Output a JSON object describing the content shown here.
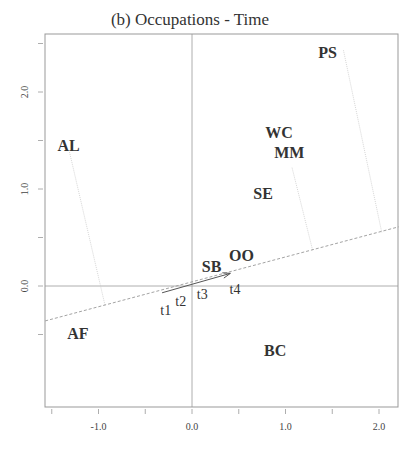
{
  "chart_data": {
    "type": "scatter",
    "title": "(b) Occupations - Time",
    "xlabel": "",
    "ylabel": "",
    "xlim": [
      -1.57,
      2.21
    ],
    "ylim": [
      -1.25,
      2.6
    ],
    "grid": false,
    "reference_lines": {
      "x0": true,
      "y0": true
    },
    "x_ticks": [
      -1.5,
      -1.0,
      -0.5,
      0.0,
      0.5,
      1.0,
      1.5,
      2.0
    ],
    "x_tick_labels": [
      {
        "value": -1.0,
        "label": "-1.0"
      },
      {
        "value": 0.0,
        "label": "0.0"
      },
      {
        "value": 1.0,
        "label": "1.0"
      },
      {
        "value": 2.0,
        "label": "2.0"
      }
    ],
    "y_ticks": [
      -0.5,
      0.0,
      0.5,
      1.0,
      1.5,
      2.0,
      2.5
    ],
    "y_tick_labels": [
      {
        "value": 0.0,
        "label": "0.0"
      },
      {
        "value": 1.0,
        "label": "1.0"
      },
      {
        "value": 2.0,
        "label": "2.0"
      }
    ],
    "series": [
      {
        "name": "Occupations",
        "style": "bold-label",
        "points": [
          {
            "label": "PS",
            "x": 1.45,
            "y": 2.41
          },
          {
            "label": "WC",
            "x": 0.93,
            "y": 1.59
          },
          {
            "label": "MM",
            "x": 1.04,
            "y": 1.38
          },
          {
            "label": "SE",
            "x": 0.76,
            "y": 0.96
          },
          {
            "label": "AL",
            "x": -1.32,
            "y": 1.45
          },
          {
            "label": "AF",
            "x": -1.22,
            "y": -0.48
          },
          {
            "label": "BC",
            "x": 0.89,
            "y": -0.66
          },
          {
            "label": "SB",
            "x": 0.21,
            "y": 0.21
          },
          {
            "label": "OO",
            "x": 0.53,
            "y": 0.32
          }
        ]
      },
      {
        "name": "Time",
        "style": "plain-label",
        "points": [
          {
            "label": "t1",
            "x": -0.28,
            "y": -0.24
          },
          {
            "label": "t2",
            "x": -0.12,
            "y": -0.14
          },
          {
            "label": "t3",
            "x": 0.11,
            "y": -0.07
          },
          {
            "label": "t4",
            "x": 0.46,
            "y": -0.02
          }
        ]
      }
    ],
    "arrow": {
      "from": {
        "x": -0.32,
        "y": -0.07
      },
      "to": {
        "x": 0.41,
        "y": 0.13
      }
    },
    "dashed_axis": {
      "from": {
        "x": -1.57,
        "y": -0.36
      },
      "to": {
        "x": 2.21,
        "y": 0.61
      }
    },
    "projections": [
      {
        "label": "AL",
        "from": {
          "x": -1.31,
          "y": 1.38
        },
        "to": {
          "x": -0.93,
          "y": -0.2
        }
      },
      {
        "label": "MM",
        "from": {
          "x": 1.07,
          "y": 1.22
        },
        "to": {
          "x": 1.29,
          "y": 0.37
        }
      },
      {
        "label": "PS",
        "from": {
          "x": 1.62,
          "y": 2.43
        },
        "to": {
          "x": 2.03,
          "y": 0.55
        }
      }
    ]
  },
  "colors": {
    "axis": "#999999",
    "text": "#333333",
    "dashed": "#999999",
    "projection": "#cccccc",
    "arrow": "#555555"
  }
}
